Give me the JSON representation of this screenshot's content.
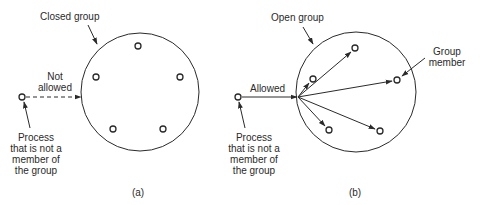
{
  "panel_a": {
    "title": "Closed group",
    "arrow_label_line1": "Not",
    "arrow_label_line2": "allowed",
    "outside_label": [
      "Process",
      "that is not a",
      "member of",
      "the group"
    ],
    "caption": "(a)",
    "member_count": 5
  },
  "panel_b": {
    "title": "Open group",
    "arrow_label": "Allowed",
    "member_label_line1": "Group",
    "member_label_line2": "member",
    "outside_label": [
      "Process",
      "that is not a",
      "member of",
      "the group"
    ],
    "caption": "(b)",
    "member_count": 5
  },
  "colors": {
    "stroke": "#2a2a2a",
    "background": "#ffffff"
  }
}
